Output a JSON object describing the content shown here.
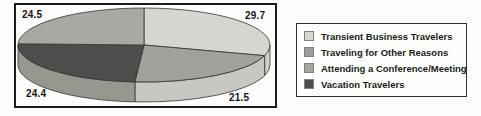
{
  "chart_data": {
    "type": "pie",
    "style": "3d",
    "title": "",
    "unit": "percent",
    "start_angle_deg": 90,
    "direction": "clockwise",
    "legend_position": "right",
    "slices": [
      {
        "name": "Transient Business Travelers",
        "value": 29.7,
        "display": "29.7",
        "color": "#d6d5d0",
        "side_color": "#d0cfca",
        "label_corner": "tr"
      },
      {
        "name": "Traveling for Other Reasons",
        "value": 21.5,
        "display": "21.5",
        "color": "#a2a19c",
        "side_color": "#c8c7c2",
        "label_corner": "br"
      },
      {
        "name": "Vacation Travelers",
        "value": 24.4,
        "display": "24.4",
        "color": "#4e4d4b",
        "side_color": "#98978f",
        "label_corner": "bl"
      },
      {
        "name": "Attending a Conference/Meeting",
        "value": 24.5,
        "display": "24.5",
        "color": "#a9a8a3",
        "side_color": "#a9a8a3",
        "label_corner": "tl"
      }
    ]
  },
  "legend": {
    "items": [
      {
        "label": "Transient Business Travelers",
        "color": "#d8d7d2"
      },
      {
        "label": "Traveling for Other Reasons",
        "color": "#9e9d99"
      },
      {
        "label": "Attending a Conference/Meeting",
        "color": "#a6a5a0"
      },
      {
        "label": "Vacation Travelers",
        "color": "#4e4d4b"
      }
    ]
  }
}
